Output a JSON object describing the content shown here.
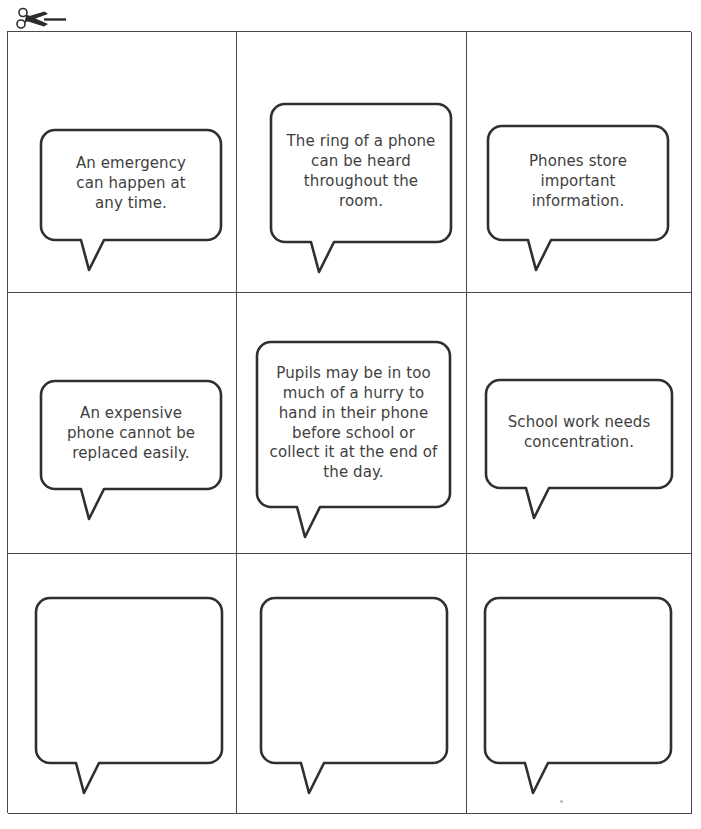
{
  "page": {
    "cut_marker_icon": "scissors-icon",
    "ink_color": "#3f3f3f",
    "grid_line_color": "#4a4a4a",
    "background_color": "#ffffff",
    "columns": 3,
    "rows": 3
  },
  "cards": [
    {
      "index": 1,
      "row": 1,
      "column": 1,
      "text": "An emergency\ncan happen at\nany time.",
      "empty": false
    },
    {
      "index": 2,
      "row": 1,
      "column": 2,
      "text": "The ring of a phone\ncan be heard\nthroughout the\nroom.",
      "empty": false
    },
    {
      "index": 3,
      "row": 1,
      "column": 3,
      "text": "Phones store\nimportant\ninformation.",
      "empty": false
    },
    {
      "index": 4,
      "row": 2,
      "column": 1,
      "text": "An expensive\nphone cannot be\nreplaced easily.",
      "empty": false
    },
    {
      "index": 5,
      "row": 2,
      "column": 2,
      "text": "Pupils may be in too\nmuch of a hurry to\nhand in their phone\nbefore school or\ncollect it at the end of\nthe day.",
      "empty": false
    },
    {
      "index": 6,
      "row": 2,
      "column": 3,
      "text": "School work needs\nconcentration.",
      "empty": false
    },
    {
      "index": 7,
      "row": 3,
      "column": 1,
      "text": "",
      "empty": true
    },
    {
      "index": 8,
      "row": 3,
      "column": 2,
      "text": "",
      "empty": true
    },
    {
      "index": 9,
      "row": 3,
      "column": 3,
      "text": "",
      "empty": true
    }
  ]
}
